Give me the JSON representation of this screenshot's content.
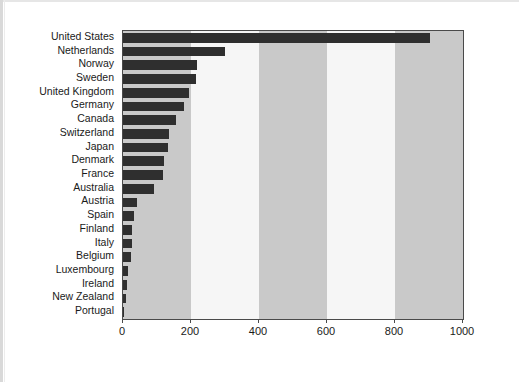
{
  "chart_data": {
    "type": "bar",
    "orientation": "horizontal",
    "title": "",
    "subtitle": "",
    "xlabel": "",
    "ylabel": "",
    "xlim": [
      0,
      1000
    ],
    "ylim": null,
    "grid": false,
    "legend": null,
    "legend_position": "none",
    "xticks": [
      "0",
      "200",
      "400",
      "600",
      "800",
      "1000"
    ],
    "xtick_values": [
      0,
      200,
      400,
      600,
      800,
      1000
    ],
    "categories": [
      "United States",
      "Netherlands",
      "Norway",
      "Sweden",
      "United Kingdom",
      "Germany",
      "Canada",
      "Switzerland",
      "Japan",
      "Denmark",
      "France",
      "Australia",
      "Austria",
      "Spain",
      "Finland",
      "Italy",
      "Belgium",
      "Luxembourg",
      "Ireland",
      "New Zealand",
      "Portugal"
    ],
    "values": [
      903,
      300,
      218,
      215,
      194,
      180,
      156,
      135,
      132,
      121,
      118,
      91,
      40,
      33,
      27,
      25,
      24,
      15,
      13,
      9,
      2
    ],
    "bands": [
      {
        "from": 0,
        "to": 200,
        "shade": "shaded"
      },
      {
        "from": 200,
        "to": 400,
        "shade": "plain"
      },
      {
        "from": 400,
        "to": 600,
        "shade": "shaded"
      },
      {
        "from": 600,
        "to": 800,
        "shade": "plain"
      },
      {
        "from": 800,
        "to": 1000,
        "shade": "shaded"
      }
    ],
    "colors": {
      "bar": "#2f2f2f",
      "band_shaded": "#c9c9c9",
      "band_plain": "#f6f6f6",
      "frame": "#4a4a4a",
      "text": "#1a1a1a",
      "background": "#ffffff"
    }
  }
}
